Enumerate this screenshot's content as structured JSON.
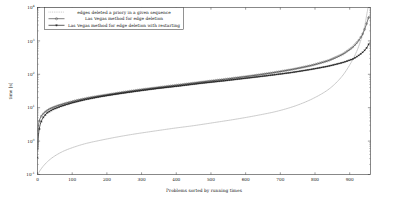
{
  "chart_data": {
    "type": "line",
    "title": "",
    "xlabel": "Problems sorted by running times",
    "ylabel": "time [s]",
    "xlim": [
      0,
      960
    ],
    "ylim_log10": [
      -1,
      4
    ],
    "y_scale": "log",
    "x_ticks": [
      0,
      100,
      200,
      300,
      400,
      500,
      600,
      700,
      800,
      900
    ],
    "x_tick_labels": [
      "0",
      "100",
      "200",
      "300",
      "400",
      "500",
      "600",
      "700",
      "800",
      "900"
    ],
    "y_ticks_log10": [
      -1,
      0,
      1,
      2,
      3,
      4
    ],
    "y_tick_labels": [
      "10",
      "10",
      "10",
      "10",
      "10",
      "10"
    ],
    "y_tick_exponents": [
      "-1",
      "0",
      "1",
      "2",
      "3",
      "4"
    ],
    "grid": false,
    "legend_position": "top-left",
    "series": [
      {
        "name": "edges deleted a priory in a given sequence",
        "marker": "none",
        "line_style": "dotted",
        "color": "#9a9a9a",
        "x": [
          2,
          8,
          18,
          32,
          50,
          75,
          105,
          140,
          180,
          225,
          275,
          330,
          390,
          450,
          510,
          570,
          630,
          690,
          745,
          795,
          840,
          875,
          900,
          918,
          930,
          938,
          944,
          948,
          952,
          956
        ],
        "y": [
          0.105,
          0.135,
          0.185,
          0.26,
          0.36,
          0.5,
          0.66,
          0.85,
          1.05,
          1.3,
          1.6,
          1.95,
          2.4,
          2.9,
          3.6,
          4.5,
          5.8,
          7.8,
          11.5,
          19,
          36,
          80,
          190,
          430,
          900,
          1700,
          3000,
          5200,
          9000,
          17000
        ]
      },
      {
        "name": "Las Vegas method for edge deletion",
        "marker": "circle",
        "line_style": "solid",
        "color": "#4a4a4a",
        "x": [
          1,
          4,
          10,
          20,
          35,
          55,
          80,
          112,
          150,
          195,
          245,
          300,
          360,
          420,
          480,
          545,
          610,
          675,
          735,
          790,
          840,
          880,
          908,
          925,
          936,
          943,
          948,
          952,
          956
        ],
        "y": [
          2.0,
          3.6,
          5.4,
          7.2,
          9.2,
          11.2,
          13.5,
          16.5,
          20,
          24,
          29,
          35,
          42,
          50,
          60,
          72,
          88,
          110,
          140,
          185,
          260,
          400,
          640,
          1000,
          1500,
          2200,
          3100,
          4200,
          5500
        ]
      },
      {
        "name": "Las Vegas method for edge deletion with restarting",
        "marker": "star",
        "line_style": "solid",
        "color": "#1a1a1a",
        "x": [
          1,
          3,
          8,
          16,
          28,
          46,
          70,
          100,
          138,
          182,
          232,
          288,
          348,
          410,
          472,
          538,
          604,
          670,
          732,
          788,
          838,
          880,
          910,
          928,
          940,
          948,
          953,
          956
        ],
        "y": [
          0.55,
          1.6,
          3.2,
          5.0,
          7.0,
          9.0,
          11.2,
          14,
          17.5,
          21.5,
          26,
          31.5,
          38,
          45,
          54,
          64,
          77,
          93,
          113,
          140,
          175,
          225,
          290,
          380,
          480,
          600,
          730,
          850
        ]
      }
    ]
  },
  "legend": {
    "entries": [
      {
        "label": "edges deleted a priory in a given sequence",
        "marker": "none"
      },
      {
        "label": "Las Vegas method for edge deletion",
        "marker": "circle"
      },
      {
        "label": "Las Vegas method for edge deletion with restarting",
        "marker": "star"
      }
    ]
  }
}
